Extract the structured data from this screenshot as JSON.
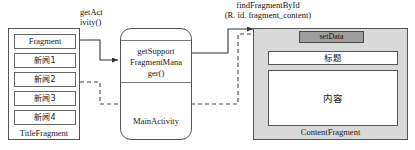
{
  "diagram": {
    "type": "android-fragment-communication-diagram",
    "title_fragment": {
      "caption": "TitleFragment",
      "items": [
        {
          "label": "Fragment"
        },
        {
          "label": "新闻1"
        },
        {
          "label": "新闻2"
        },
        {
          "label": "新闻3"
        },
        {
          "label": "新闻4"
        }
      ]
    },
    "main_activity": {
      "caption": "MainActivity",
      "method_line1": "getSupport",
      "method_line2": "FragmentMana",
      "method_line3": "ger()"
    },
    "content_fragment": {
      "caption": "ContentFragment",
      "set_data_label": "setData",
      "title_box_label": "标题",
      "content_box_label": "内容"
    },
    "connector_labels": {
      "get_activity_line1": "getAct",
      "get_activity_line2": "ivity()",
      "find_fragment_line1": "findFragmentById",
      "find_fragment_prefix": "(R. id. ",
      "find_fragment_italic": "fragment_content",
      "find_fragment_suffix": ")"
    },
    "colors": {
      "background": "#ffffff",
      "stroke": "#555555",
      "content_fragment_fill": "#d9d9d9",
      "set_data_fill": "#9e9e9e",
      "inner_box_fill": "#ffffff"
    }
  }
}
